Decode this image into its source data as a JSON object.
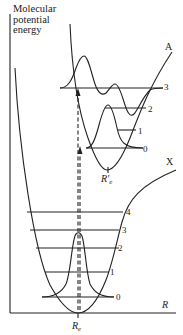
{
  "diagram": {
    "y_axis_label": [
      "Molecular",
      "potential",
      "energy"
    ],
    "x_axis_label": "R",
    "ground_state": {
      "label": "X",
      "equilibrium_label": "R",
      "equilibrium_sub": "e",
      "levels": [
        "0",
        "1",
        "2",
        "3",
        "4"
      ]
    },
    "excited_state": {
      "label": "A",
      "equilibrium_label": "R′",
      "equilibrium_sub": "e",
      "levels": [
        "0",
        "1",
        "2",
        "3"
      ]
    },
    "transition": {
      "style": "dashed vertical arrow",
      "from": "X v=0",
      "to": "A v=3"
    },
    "colors": {
      "line": "#222222",
      "background": "#ffffff"
    }
  }
}
